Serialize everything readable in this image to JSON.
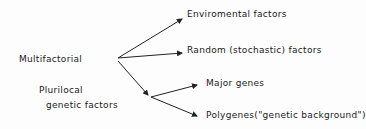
{
  "diagram": {
    "source_label": "Multifactorial",
    "sub_label_line1": "Plurilocal",
    "sub_label_line2": "genetic factors",
    "targets": [
      {
        "label": "Enviromental factors"
      },
      {
        "label": "Random (stochastic) factors"
      }
    ],
    "genetic_targets": [
      {
        "label": "Major genes"
      },
      {
        "label": "Polygenes(\"genetic background\")"
      }
    ],
    "line_color": "#222222"
  }
}
